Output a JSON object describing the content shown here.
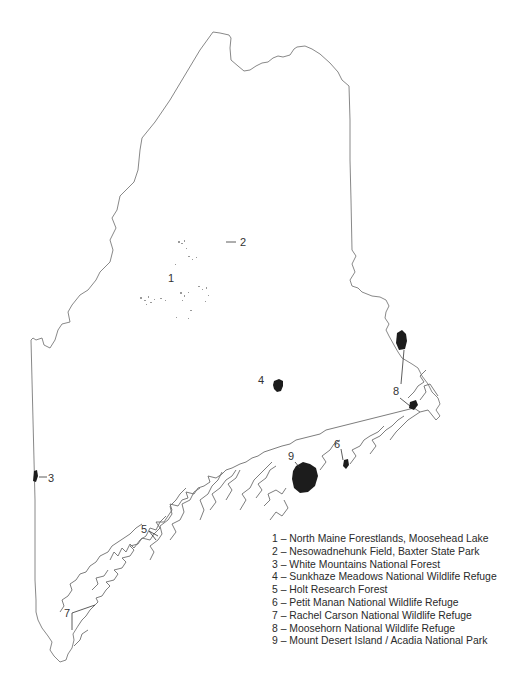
{
  "map": {
    "region": "Maine",
    "markers": [
      {
        "id": "1",
        "label": "1",
        "x": 168,
        "y": 282
      },
      {
        "id": "2",
        "label": "2",
        "x": 243,
        "y": 246
      },
      {
        "id": "3",
        "label": "3",
        "x": 50,
        "y": 482
      },
      {
        "id": "4",
        "label": "4",
        "x": 259,
        "y": 384
      },
      {
        "id": "5",
        "label": "5",
        "x": 142,
        "y": 533
      },
      {
        "id": "6",
        "label": "6",
        "x": 335,
        "y": 448
      },
      {
        "id": "7",
        "label": "7",
        "x": 66,
        "y": 617
      },
      {
        "id": "8",
        "label": "8",
        "x": 394,
        "y": 395
      },
      {
        "id": "9",
        "label": "9",
        "x": 290,
        "y": 460
      }
    ]
  },
  "legend": {
    "items": [
      {
        "number": "1",
        "text": "1 – North Maine Forestlands, Moosehead Lake"
      },
      {
        "number": "2",
        "text": "2 – Nesowadnehunk Field, Baxter State Park"
      },
      {
        "number": "3",
        "text": "3 – White Mountains National Forest"
      },
      {
        "number": "4",
        "text": "4 – Sunkhaze Meadows National Wildlife Refuge"
      },
      {
        "number": "5",
        "text": "5 – Holt Research Forest"
      },
      {
        "number": "6",
        "text": "6 – Petit Manan National Wildlife Refuge"
      },
      {
        "number": "7",
        "text": "7 – Rachel Carson National Wildlife Refuge"
      },
      {
        "number": "8",
        "text": "8 – Moosehorn National Wildlife Refuge"
      },
      {
        "number": "9",
        "text": "9 – Mount Desert Island / Acadia National Park"
      }
    ]
  },
  "colors": {
    "background": "#ffffff",
    "outline": "#7a7a7a",
    "site_fill": "#1c1c1c",
    "text": "#2a2a2a"
  }
}
